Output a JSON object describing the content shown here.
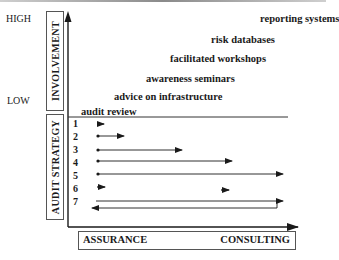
{
  "diagram": {
    "y_axis": {
      "title": "INVOLVEMENT",
      "high_label": "HIGH",
      "low_label": "LOW"
    },
    "strategy_axis": {
      "title": "AUDIT STRATEGY"
    },
    "x_axis": {
      "left_label": "ASSURANCE",
      "right_label": "CONSULTING"
    },
    "services": [
      {
        "label": "audit review"
      },
      {
        "label": "advice on infrastructure"
      },
      {
        "label": "awareness seminars"
      },
      {
        "label": "facilitated workshops"
      },
      {
        "label": "risk databases"
      },
      {
        "label": "reporting systems"
      }
    ],
    "strategies": [
      {
        "num": "1",
        "type": "short-arrow"
      },
      {
        "num": "2",
        "type": "dot-to-arrow"
      },
      {
        "num": "3",
        "type": "dot-to-arrow"
      },
      {
        "num": "4",
        "type": "dot-to-arrow"
      },
      {
        "num": "5",
        "type": "dot-to-arrow"
      },
      {
        "num": "6",
        "type": "two-short-arrows"
      },
      {
        "num": "7",
        "type": "loop-back-arrow"
      }
    ],
    "colors": {
      "ink": "#1a1a1a",
      "box_border": "#555555"
    }
  }
}
